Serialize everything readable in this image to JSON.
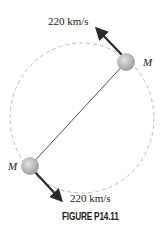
{
  "figure": {
    "caption": "FIGURE P14.11",
    "mass_top": {
      "label": "M"
    },
    "mass_bottom": {
      "label": "M"
    },
    "velocity_top": {
      "label": "220 km/s"
    },
    "velocity_bottom": {
      "label": "220 km/s"
    }
  }
}
